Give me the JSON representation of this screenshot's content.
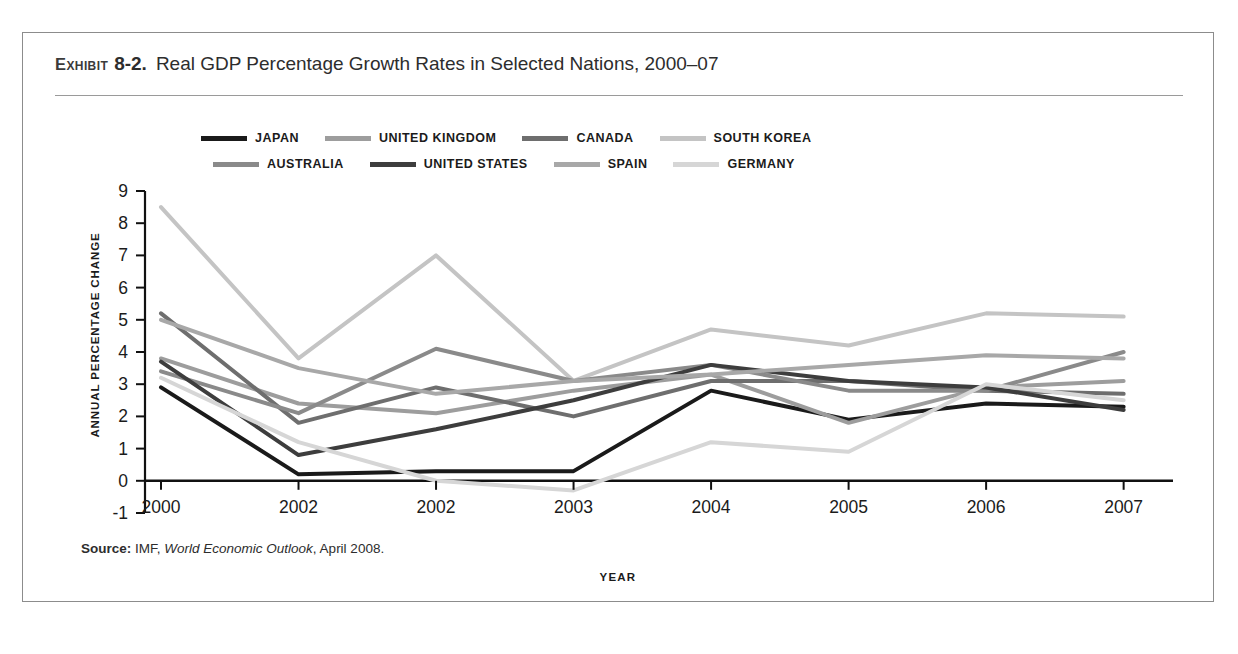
{
  "exhibit": {
    "label": "EXHIBIT",
    "number": "8-2.",
    "title": "Real GDP Percentage Growth Rates in Selected Nations, 2000–07"
  },
  "source": {
    "prefix": "Source:",
    "agency": "IMF,",
    "publication": "World Economic Outlook",
    "date": ", April 2008."
  },
  "axes": {
    "ylabel": "ANNUAL PERCENTAGE CHANGE",
    "xlabel": "YEAR",
    "ytick_labels": [
      "9",
      "8",
      "7",
      "6",
      "5",
      "4",
      "3",
      "2",
      "1",
      "0",
      "-1"
    ]
  },
  "legend": {
    "rows": [
      [
        {
          "name": "JAPAN",
          "color": "#1a1a1a"
        },
        {
          "name": "UNITED KINGDOM",
          "color": "#9d9d9d"
        },
        {
          "name": "CANADA",
          "color": "#6e6e6e"
        },
        {
          "name": "SOUTH KOREA",
          "color": "#c4c4c4"
        }
      ],
      [
        {
          "name": "AUSTRALIA",
          "color": "#8a8a8a"
        },
        {
          "name": "UNITED STATES",
          "color": "#3d3d3d"
        },
        {
          "name": "SPAIN",
          "color": "#a8a8a8"
        },
        {
          "name": "GERMANY",
          "color": "#d6d6d6"
        }
      ]
    ]
  },
  "chart_data": {
    "type": "line",
    "title": "Real GDP Percentage Growth Rates in Selected Nations, 2000–07",
    "xlabel": "YEAR",
    "ylabel": "ANNUAL PERCENTAGE CHANGE",
    "categories": [
      "2000",
      "2002",
      "2002",
      "2003",
      "2004",
      "2005",
      "2006",
      "2007"
    ],
    "ylim": [
      -1,
      9
    ],
    "yticks": [
      -1,
      0,
      1,
      2,
      3,
      4,
      5,
      6,
      7,
      8,
      9
    ],
    "grid": false,
    "legend_position": "top",
    "series": [
      {
        "name": "JAPAN",
        "color": "#1a1a1a",
        "width": 4.0,
        "values": [
          2.9,
          0.2,
          0.3,
          0.3,
          2.8,
          1.9,
          2.4,
          2.3
        ]
      },
      {
        "name": "UNITED KINGDOM",
        "color": "#9d9d9d",
        "width": 4.0,
        "values": [
          3.8,
          2.4,
          2.1,
          2.8,
          3.3,
          1.8,
          2.9,
          3.1
        ]
      },
      {
        "name": "CANADA",
        "color": "#6e6e6e",
        "width": 4.0,
        "values": [
          5.2,
          1.8,
          2.9,
          2.0,
          3.1,
          3.1,
          2.8,
          2.7
        ]
      },
      {
        "name": "SOUTH KOREA",
        "color": "#c4c4c4",
        "width": 4.0,
        "values": [
          8.5,
          3.8,
          7.0,
          3.1,
          4.7,
          4.2,
          5.2,
          5.1
        ]
      },
      {
        "name": "AUSTRALIA",
        "color": "#8a8a8a",
        "width": 4.0,
        "values": [
          3.4,
          2.1,
          4.1,
          3.1,
          3.6,
          2.8,
          2.8,
          4.0
        ]
      },
      {
        "name": "UNITED STATES",
        "color": "#3d3d3d",
        "width": 4.0,
        "values": [
          3.7,
          0.8,
          1.6,
          2.5,
          3.6,
          3.1,
          2.9,
          2.2
        ]
      },
      {
        "name": "SPAIN",
        "color": "#a8a8a8",
        "width": 4.0,
        "values": [
          5.0,
          3.5,
          2.7,
          3.1,
          3.3,
          3.6,
          3.9,
          3.8
        ]
      },
      {
        "name": "GERMANY",
        "color": "#d6d6d6",
        "width": 4.0,
        "values": [
          3.2,
          1.2,
          0.0,
          -0.3,
          1.2,
          0.9,
          3.0,
          2.5
        ]
      }
    ]
  }
}
